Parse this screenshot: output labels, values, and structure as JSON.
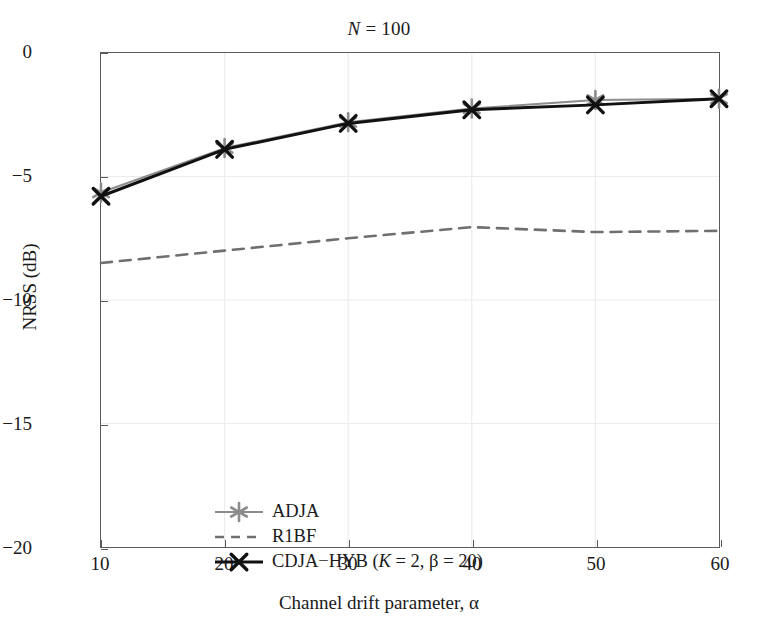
{
  "chart_data": {
    "type": "line",
    "title": "N = 100",
    "title_parts": {
      "symbol": "N",
      "relation": " = 100"
    },
    "xlabel": "Channel drift parameter, α",
    "ylabel": "NRSS (dB)",
    "x": [
      10,
      20,
      30,
      40,
      50,
      60
    ],
    "xlim": [
      10,
      60
    ],
    "ylim": [
      -20,
      0
    ],
    "xticks": [
      10,
      20,
      30,
      40,
      50,
      60
    ],
    "yticks": [
      0,
      -5,
      -10,
      -15,
      -20
    ],
    "xtick_labels": [
      "10",
      "20",
      "30",
      "40",
      "50",
      "60"
    ],
    "ytick_labels": [
      "0",
      "−5",
      "−10",
      "−15",
      "−20"
    ],
    "grid": true,
    "legend_position": "lower left",
    "series": [
      {
        "name": "ADJA",
        "values": [
          -5.65,
          -3.85,
          -2.8,
          -2.25,
          -1.9,
          -1.85
        ],
        "color": "#8c8c8c",
        "marker": "asterisk",
        "linestyle": "solid",
        "linewidth": 2.0
      },
      {
        "name": "R1BF",
        "values": [
          -8.5,
          -8.0,
          -7.5,
          -7.05,
          -7.25,
          -7.2
        ],
        "color": "#6f6f6f",
        "marker": "none",
        "linestyle": "dashed",
        "linewidth": 2.6
      },
      {
        "name": "CDJA−HYB (K = 2, β = 20)",
        "name_parts": {
          "prefix": "CDJA−HYB (",
          "sym1": "K",
          "mid": " = 2, ",
          "sym2": "β",
          "suffix": " = 20)"
        },
        "values": [
          -5.8,
          -3.9,
          -2.85,
          -2.3,
          -2.1,
          -1.85
        ],
        "color": "#111111",
        "marker": "x",
        "linestyle": "solid",
        "linewidth": 3.0
      }
    ]
  },
  "style": {
    "axis_color": "#5a5a5a",
    "grid_color": "#ececed",
    "background": "#ffffff",
    "text_color": "#1a1a1a"
  }
}
